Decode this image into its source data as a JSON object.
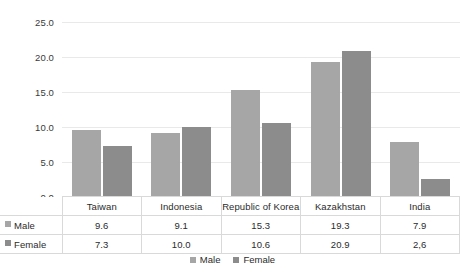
{
  "chart_data": {
    "type": "bar",
    "title": "",
    "xlabel": "",
    "ylabel": "",
    "ylim": [
      0,
      25
    ],
    "ytick_step": 5,
    "ytick_labels": [
      "25.0",
      "20.0",
      "15.0",
      "10.0",
      "5.0",
      "0.0"
    ],
    "ytick_values": [
      25,
      20,
      15,
      10,
      5,
      0
    ],
    "grid": true,
    "legend_position": "bottom-center",
    "categories": [
      "Taiwan",
      "Indonesia",
      "Republic of Korea",
      "Kazakhstan",
      "India"
    ],
    "series": [
      {
        "name": "Male",
        "color": "#a6a6a6",
        "values": [
          9.6,
          9.1,
          15.3,
          19.3,
          7.9
        ],
        "labels": [
          "9.6",
          "9.1",
          "15.3",
          "19.3",
          "7.9"
        ]
      },
      {
        "name": "Female",
        "color": "#8c8c8c",
        "values": [
          7.3,
          10.0,
          10.6,
          20.9,
          2.6
        ],
        "labels": [
          "7.3",
          "10.0",
          "10.6",
          "20.9",
          "2,6"
        ]
      }
    ]
  },
  "data_table": {
    "row_headers": [
      "Male",
      "Female"
    ],
    "column_headers": [
      "Taiwan",
      "Indonesia",
      "Republic of Korea",
      "Kazakhstan",
      "India"
    ],
    "rows": [
      [
        "9.6",
        "9.1",
        "15.3",
        "19.3",
        "7.9"
      ],
      [
        "7.3",
        "10.0",
        "10.6",
        "20.9",
        "2,6"
      ]
    ]
  },
  "legend": {
    "items": [
      {
        "label": "Male",
        "color": "#a6a6a6"
      },
      {
        "label": "Female",
        "color": "#8c8c8c"
      }
    ]
  },
  "colors": {
    "male": "#a6a6a6",
    "female": "#8c8c8c",
    "gridline": "#e9e9e9",
    "table_border": "#d9d9d9",
    "text": "#2b2b2b",
    "background": "#ffffff"
  }
}
